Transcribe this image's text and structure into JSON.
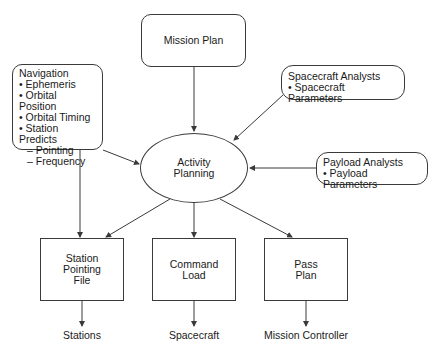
{
  "diagram": {
    "mission_plan": {
      "label": "Mission Plan"
    },
    "navigation": {
      "title": "Navigation",
      "items": [
        "Ephemeris",
        "Orbital Position",
        "Orbital Timing",
        "Station Predicts"
      ],
      "subitems": [
        "Pointing",
        "Frequency"
      ]
    },
    "spacecraft_analysts": {
      "title": "Spacecraft Analysts",
      "items": [
        "Spacecraft Parameters"
      ]
    },
    "payload_analysts": {
      "title": "Payload Analysts",
      "items": [
        "Payload Parameters"
      ]
    },
    "activity_planning": {
      "lines": [
        "Activity",
        "Planning"
      ]
    },
    "station_pointing_file": {
      "lines": [
        "Station",
        "Pointing",
        "File"
      ]
    },
    "command_load": {
      "lines": [
        "Command",
        "Load"
      ]
    },
    "pass_plan": {
      "lines": [
        "Pass",
        "Plan"
      ]
    },
    "outputs": {
      "stations": "Stations",
      "spacecraft": "Spacecraft",
      "mission_controller": "Mission Controller"
    },
    "colors": {
      "stroke": "#3a3a3a",
      "text": "#1a1a1a",
      "background": "#ffffff"
    }
  }
}
